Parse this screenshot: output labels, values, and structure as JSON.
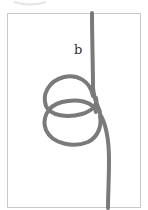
{
  "figure": {
    "label": "b",
    "colors": {
      "rope": "#7a7a7a",
      "rope_highlight": "#a8a8a8",
      "frame_border": "#c8c8c8",
      "background": "#ffffff"
    }
  }
}
